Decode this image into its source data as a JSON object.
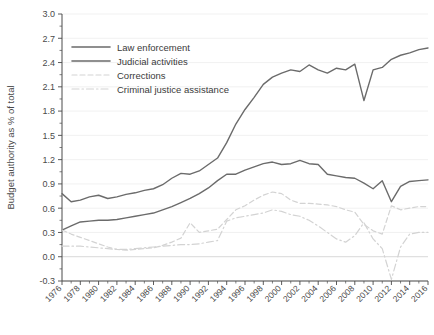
{
  "chart_data": {
    "type": "line",
    "title": "",
    "xlabel": "",
    "ylabel": "Budget authority as % of total",
    "xlim": [
      1976,
      2016
    ],
    "ylim": [
      -0.3,
      3.0
    ],
    "grid": true,
    "legend_position": "top-left",
    "ytick_labels": [
      "3.0",
      "2.7",
      "2.4",
      "2.1",
      "1.8",
      "1.5",
      "1.2",
      "0.9",
      "0.6",
      "0.3",
      "0.0",
      "-0.3"
    ],
    "ytick_values": [
      3.0,
      2.7,
      2.4,
      2.1,
      1.8,
      1.5,
      1.2,
      0.9,
      0.6,
      0.3,
      0.0,
      -0.3
    ],
    "xtick_labels": [
      "1976",
      "1978",
      "1980",
      "1982",
      "1984",
      "1986",
      "1988",
      "1990",
      "1992",
      "1994",
      "1996",
      "1998",
      "2000",
      "2002",
      "2004",
      "2006",
      "2008",
      "2010",
      "2012",
      "2014",
      "2016"
    ],
    "xtick_values": [
      1976,
      1978,
      1980,
      1982,
      1984,
      1986,
      1988,
      1990,
      1992,
      1994,
      1996,
      1998,
      2000,
      2002,
      2004,
      2006,
      2008,
      2010,
      2012,
      2014,
      2016
    ],
    "x": [
      1976,
      1977,
      1978,
      1979,
      1980,
      1981,
      1982,
      1983,
      1984,
      1985,
      1986,
      1987,
      1988,
      1989,
      1990,
      1991,
      1992,
      1993,
      1994,
      1995,
      1996,
      1997,
      1998,
      1999,
      2000,
      2001,
      2002,
      2003,
      2004,
      2005,
      2006,
      2007,
      2008,
      2009,
      2010,
      2011,
      2012,
      2013,
      2014,
      2015,
      2016
    ],
    "series": [
      {
        "name": "Law enforcement",
        "color": "#6b6b6b",
        "style": "solid",
        "values": [
          0.78,
          0.68,
          0.7,
          0.74,
          0.76,
          0.72,
          0.74,
          0.77,
          0.79,
          0.82,
          0.84,
          0.89,
          0.97,
          1.03,
          1.02,
          1.06,
          1.14,
          1.22,
          1.41,
          1.64,
          1.82,
          1.97,
          2.13,
          2.22,
          2.27,
          2.31,
          2.29,
          2.37,
          2.31,
          2.27,
          2.33,
          2.31,
          2.38,
          1.93,
          2.31,
          2.34,
          2.44,
          2.49,
          2.52,
          2.56,
          2.58
        ]
      },
      {
        "name": "Judicial activities",
        "color": "#6b6b6b",
        "style": "solid",
        "values": [
          0.33,
          0.38,
          0.43,
          0.44,
          0.45,
          0.45,
          0.46,
          0.48,
          0.5,
          0.52,
          0.54,
          0.58,
          0.62,
          0.67,
          0.72,
          0.78,
          0.85,
          0.94,
          1.02,
          1.02,
          1.07,
          1.11,
          1.15,
          1.17,
          1.14,
          1.15,
          1.19,
          1.15,
          1.14,
          1.02,
          1.0,
          0.98,
          0.97,
          0.91,
          0.84,
          0.94,
          0.68,
          0.87,
          0.93,
          0.94,
          0.95
        ]
      },
      {
        "name": "Corrections",
        "color": "#d3d3d3",
        "style": "dashed",
        "values": [
          0.33,
          0.28,
          0.24,
          0.2,
          0.16,
          0.12,
          0.09,
          0.08,
          0.09,
          0.1,
          0.11,
          0.14,
          0.18,
          0.23,
          0.42,
          0.3,
          0.32,
          0.34,
          0.46,
          0.58,
          0.63,
          0.7,
          0.76,
          0.8,
          0.78,
          0.7,
          0.66,
          0.66,
          0.65,
          0.64,
          0.62,
          0.58,
          0.55,
          0.4,
          0.32,
          0.28,
          0.63,
          0.58,
          0.6,
          0.62,
          0.62
        ]
      },
      {
        "name": "Criminal justice assistance",
        "color": "#d3d3d3",
        "style": "dashdot",
        "values": [
          0.13,
          0.13,
          0.13,
          0.12,
          0.11,
          0.1,
          0.09,
          0.09,
          0.1,
          0.11,
          0.12,
          0.13,
          0.14,
          0.15,
          0.15,
          0.16,
          0.18,
          0.2,
          0.44,
          0.48,
          0.5,
          0.52,
          0.54,
          0.58,
          0.56,
          0.52,
          0.5,
          0.45,
          0.38,
          0.3,
          0.22,
          0.18,
          0.26,
          0.42,
          0.22,
          0.1,
          -0.28,
          0.12,
          0.28,
          0.3,
          0.3
        ]
      }
    ]
  },
  "axes": {
    "ylabel": "Budget authority as % of total"
  }
}
